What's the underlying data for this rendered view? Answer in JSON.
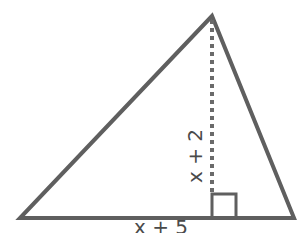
{
  "diagram": {
    "type": "triangle-with-altitude",
    "stroke_color": "#5f5f5f",
    "label_color": "#4a4a4a",
    "vertices": {
      "left": [
        20,
        218
      ],
      "right": [
        294,
        218
      ],
      "apex": [
        212,
        16
      ]
    },
    "altitude": {
      "foot": [
        212,
        218
      ],
      "style": "dashed"
    },
    "right_angle_marker": {
      "x": 212,
      "y": 194,
      "size": 24
    },
    "labels": {
      "base": "x + 5",
      "height": "x + 2"
    }
  }
}
